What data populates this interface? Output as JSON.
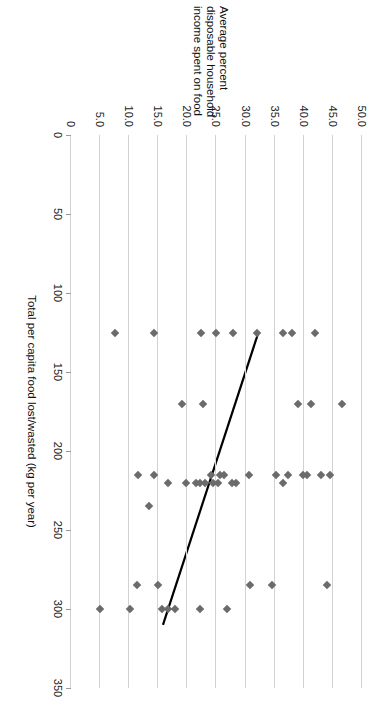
{
  "chart_data": {
    "type": "scatter",
    "title": "",
    "xlabel": "Total per capita food lost/wasted (kg per year)",
    "ylabel": "Average percent disposable household income spent on food",
    "ylabel_lines": [
      "Average percent",
      "disposable household",
      "income spent on food"
    ],
    "xlim": [
      0,
      350
    ],
    "ylim": [
      0,
      50
    ],
    "x_ticks": [
      0,
      50,
      100,
      150,
      200,
      250,
      300,
      350
    ],
    "x_tick_labels": [
      "0",
      "50",
      "100",
      "150",
      "200",
      "250",
      "300",
      "350"
    ],
    "y_ticks": [
      0,
      5,
      10,
      15,
      20,
      25,
      30,
      35,
      40,
      45,
      50
    ],
    "y_tick_labels": [
      "0",
      "5.0",
      "10.0",
      "15.0",
      "20.0",
      "25.0",
      "30.0",
      "35.0",
      "40.0",
      "45.0",
      "50.0"
    ],
    "grid": "horizontal",
    "legend": "none",
    "marker": {
      "shape": "diamond",
      "color": "#6b6b6b",
      "size": 6
    },
    "series": [
      {
        "name": "Countries",
        "points": [
          [
            125,
            42.0
          ],
          [
            125,
            38.0
          ],
          [
            125,
            36.5
          ],
          [
            125,
            32.0
          ],
          [
            125,
            27.8
          ],
          [
            125,
            25.0
          ],
          [
            125,
            22.4
          ],
          [
            125,
            14.2
          ],
          [
            125,
            7.6
          ],
          [
            170,
            46.5
          ],
          [
            170,
            41.3
          ],
          [
            170,
            39.0
          ],
          [
            170,
            22.6
          ],
          [
            170,
            19.0
          ],
          [
            215,
            44.5
          ],
          [
            215,
            43.0
          ],
          [
            215,
            40.6
          ],
          [
            215,
            39.9
          ],
          [
            215,
            37.3
          ],
          [
            215,
            35.3
          ],
          [
            215,
            30.5
          ],
          [
            215,
            26.3
          ],
          [
            215,
            25.6
          ],
          [
            215,
            24.0
          ],
          [
            215,
            14.2
          ],
          [
            215,
            11.5
          ],
          [
            220,
            36.4
          ],
          [
            220,
            28.4
          ],
          [
            220,
            27.6
          ],
          [
            220,
            25.2
          ],
          [
            220,
            24.4
          ],
          [
            220,
            23.0
          ],
          [
            220,
            22.2
          ],
          [
            220,
            21.4
          ],
          [
            220,
            19.7
          ],
          [
            220,
            16.7
          ],
          [
            235,
            13.4
          ],
          [
            285,
            44.0
          ],
          [
            285,
            34.5
          ],
          [
            285,
            30.8
          ],
          [
            285,
            15.0
          ],
          [
            285,
            11.4
          ],
          [
            300,
            26.8
          ],
          [
            300,
            22.2
          ],
          [
            300,
            17.8
          ],
          [
            300,
            16.7
          ],
          [
            300,
            15.6
          ],
          [
            300,
            10.2
          ],
          [
            300,
            5.0
          ]
        ]
      }
    ],
    "trendline": {
      "type": "linear",
      "start": [
        125,
        32.2
      ],
      "end": [
        310,
        15.8
      ],
      "color": "#000000",
      "width": 2.2
    }
  }
}
